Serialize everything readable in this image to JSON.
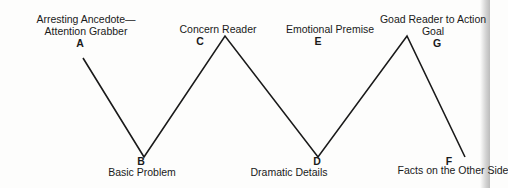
{
  "diagram": {
    "type": "zigzag-flow",
    "line_color": "#1a1a1a",
    "points": [
      {
        "id": "A",
        "label_lines": [
          "Arresting Ancedote—",
          "Attention Grabber"
        ],
        "position": "top"
      },
      {
        "id": "B",
        "label_lines": [
          "Basic Problem"
        ],
        "position": "bottom"
      },
      {
        "id": "C",
        "label_lines": [
          "Concern Reader"
        ],
        "position": "top"
      },
      {
        "id": "D",
        "label_lines": [
          "Dramatic Details"
        ],
        "position": "bottom"
      },
      {
        "id": "E",
        "label_lines": [
          "Emotional Premise"
        ],
        "position": "top"
      },
      {
        "id": "F",
        "label_lines": [
          "Facts on the Other Side"
        ],
        "position": "bottom"
      },
      {
        "id": "G",
        "label_lines": [
          "Goad Reader to Action",
          "Goal"
        ],
        "position": "top"
      }
    ]
  }
}
